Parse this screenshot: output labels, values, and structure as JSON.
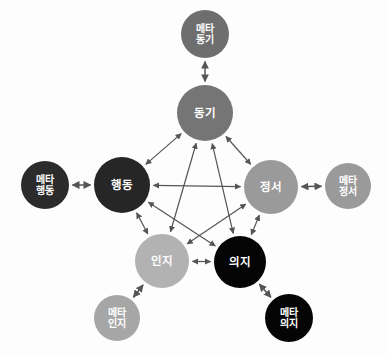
{
  "diagram": {
    "type": "network-pentagram",
    "background_color": "#fdfdfd",
    "edge_color": "#555555",
    "edge_style": "double-headed-arrow",
    "nodes": [
      {
        "id": "meta-motivation",
        "label_lines": [
          "메타",
          "동기"
        ],
        "label": "메타 동기",
        "role": "meta",
        "cx": 205,
        "cy": 34,
        "r": 24,
        "fill": "#6e6e6e",
        "text_color": "#ffffff"
      },
      {
        "id": "motivation",
        "label_lines": [
          "동기"
        ],
        "label": "동기",
        "role": "core",
        "cx": 205,
        "cy": 113,
        "r": 28,
        "fill": "#757575",
        "text_color": "#ffffff"
      },
      {
        "id": "meta-behavior",
        "label_lines": [
          "메타",
          "행동"
        ],
        "label": "메타 행동",
        "role": "meta",
        "cx": 45,
        "cy": 185,
        "r": 24,
        "fill": "#2b2b2b",
        "text_color": "#ffffff"
      },
      {
        "id": "behavior",
        "label_lines": [
          "행동"
        ],
        "label": "행동",
        "role": "core",
        "cx": 122,
        "cy": 185,
        "r": 28,
        "fill": "#262626",
        "text_color": "#ffffff"
      },
      {
        "id": "emotion",
        "label_lines": [
          "정서"
        ],
        "label": "정서",
        "role": "core",
        "cx": 271,
        "cy": 187,
        "r": 27,
        "fill": "#9a9a9a",
        "text_color": "#ffffff"
      },
      {
        "id": "meta-emotion",
        "label_lines": [
          "메타",
          "정서"
        ],
        "label": "메타 정서",
        "role": "meta",
        "cx": 348,
        "cy": 186,
        "r": 23,
        "fill": "#9a9a9a",
        "text_color": "#ffffff"
      },
      {
        "id": "cognition",
        "label_lines": [
          "인지"
        ],
        "label": "인지",
        "role": "core",
        "cx": 162,
        "cy": 261,
        "r": 27,
        "fill": "#b2b2b2",
        "text_color": "#ffffff"
      },
      {
        "id": "will",
        "label_lines": [
          "의지"
        ],
        "label": "의지",
        "role": "core",
        "cx": 240,
        "cy": 262,
        "r": 26,
        "fill": "#050505",
        "text_color": "#ffffff"
      },
      {
        "id": "meta-cognition",
        "label_lines": [
          "메타",
          "인지"
        ],
        "label": "메타 인지",
        "role": "meta",
        "cx": 117,
        "cy": 318,
        "r": 23,
        "fill": "#a6a6a6",
        "text_color": "#ffffff"
      },
      {
        "id": "meta-will",
        "label_lines": [
          "메타",
          "의지"
        ],
        "label": "메타 의지",
        "role": "meta",
        "cx": 289,
        "cy": 318,
        "r": 24,
        "fill": "#050505",
        "text_color": "#ffffff"
      }
    ],
    "edges": [
      {
        "id": "e-mot-beh",
        "from": "motivation",
        "to": "behavior",
        "kind": "pentagon"
      },
      {
        "id": "e-mot-emo",
        "from": "motivation",
        "to": "emotion",
        "kind": "pentagon"
      },
      {
        "id": "e-beh-cog",
        "from": "behavior",
        "to": "cognition",
        "kind": "pentagon"
      },
      {
        "id": "e-emo-wil",
        "from": "emotion",
        "to": "will",
        "kind": "pentagon"
      },
      {
        "id": "e-cog-wil",
        "from": "cognition",
        "to": "will",
        "kind": "pentagon"
      },
      {
        "id": "e-beh-emo",
        "from": "behavior",
        "to": "emotion",
        "kind": "star"
      },
      {
        "id": "e-mot-cog",
        "from": "motivation",
        "to": "cognition",
        "kind": "star"
      },
      {
        "id": "e-mot-wil",
        "from": "motivation",
        "to": "will",
        "kind": "star"
      },
      {
        "id": "e-beh-wil",
        "from": "behavior",
        "to": "will",
        "kind": "star"
      },
      {
        "id": "e-emo-cog",
        "from": "emotion",
        "to": "cognition",
        "kind": "star"
      },
      {
        "id": "e-meta-mot",
        "from": "meta-motivation",
        "to": "motivation",
        "kind": "meta-link"
      },
      {
        "id": "e-meta-beh",
        "from": "meta-behavior",
        "to": "behavior",
        "kind": "meta-link"
      },
      {
        "id": "e-meta-emo",
        "from": "emotion",
        "to": "meta-emotion",
        "kind": "meta-link"
      },
      {
        "id": "e-meta-cog",
        "from": "cognition",
        "to": "meta-cognition",
        "kind": "meta-link"
      },
      {
        "id": "e-meta-wil",
        "from": "will",
        "to": "meta-will",
        "kind": "meta-link"
      }
    ]
  }
}
